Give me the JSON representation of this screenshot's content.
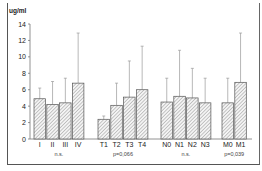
{
  "chart_data": {
    "type": "bar",
    "title": "",
    "ylabel": "ug/ml",
    "xlabel": "",
    "ylim": [
      0,
      14
    ],
    "yticks": [
      0,
      2,
      4,
      6,
      8,
      10,
      12,
      14
    ],
    "grid": false,
    "legend": null,
    "error_bars": "upper only (mean + SD)",
    "bar_pattern": "diagonal hatch",
    "groups": [
      {
        "name": "stage",
        "annotation": "n.s.",
        "categories": [
          "I",
          "II",
          "III",
          "IV"
        ],
        "values": [
          4.9,
          4.2,
          4.4,
          6.8
        ],
        "error_upper": [
          6.2,
          7.0,
          7.4,
          12.9
        ]
      },
      {
        "name": "T",
        "annotation": "p=0,066",
        "categories": [
          "T1",
          "T2",
          "T3",
          "T4"
        ],
        "values": [
          2.4,
          4.1,
          5.1,
          6.0
        ],
        "error_upper": [
          2.8,
          6.8,
          9.5,
          11.3
        ]
      },
      {
        "name": "N",
        "annotation": "n.s.",
        "categories": [
          "N0",
          "N1",
          "N2",
          "N3"
        ],
        "values": [
          4.5,
          5.2,
          5.0,
          4.4
        ],
        "error_upper": [
          7.4,
          10.8,
          8.6,
          7.4
        ]
      },
      {
        "name": "M",
        "annotation": "p=0,039",
        "categories": [
          "M0",
          "M1"
        ],
        "values": [
          4.4,
          6.9
        ],
        "error_upper": [
          7.4,
          12.9
        ]
      }
    ]
  },
  "labels": {
    "unit": "ug/ml"
  }
}
